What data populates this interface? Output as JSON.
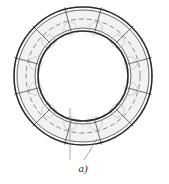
{
  "figure": {
    "caption": "a)",
    "background_color": "#ffffff",
    "geometry": {
      "center_x": 83,
      "center_y": 76,
      "outer_radius": 69,
      "band_outer_radius": 66,
      "band_inner_radius": 48,
      "inner_radius": 45,
      "centerline_radius": 57,
      "tick_overshoot_radius": 71,
      "segment_count": 12,
      "segment_start_angle_deg": 15,
      "boss_count": 12,
      "boss_radius": 6.5,
      "boss_ring_radius": 49
    },
    "colors": {
      "outline": "#2b2b2b",
      "band_fill": "#f2f2f2",
      "segment_line": "#4a4a4a",
      "dashed_centerline": "#6e6e6e",
      "boss_outline": "#bdbdbd",
      "leader_line": "#8a8a8a",
      "caption": "#2b2b2b"
    },
    "strokes": {
      "outer_circle_width": 1.6,
      "inner_circle_width": 1.6,
      "band_edge_width": 0.7,
      "segment_line_width": 0.8,
      "dashed_width": 0.8,
      "dash_pattern": "5,3",
      "boss_width": 0.7,
      "leader_width": 0.7
    },
    "leaders": [
      {
        "name": "vertical-leader",
        "x1": 70,
        "y1": 108,
        "x2": 70,
        "y2": 160
      },
      {
        "name": "diagonal-leader",
        "x1": 97,
        "y1": 139,
        "x2": 84,
        "y2": 160
      }
    ],
    "caption_position": {
      "x": 83,
      "y": 172
    }
  }
}
